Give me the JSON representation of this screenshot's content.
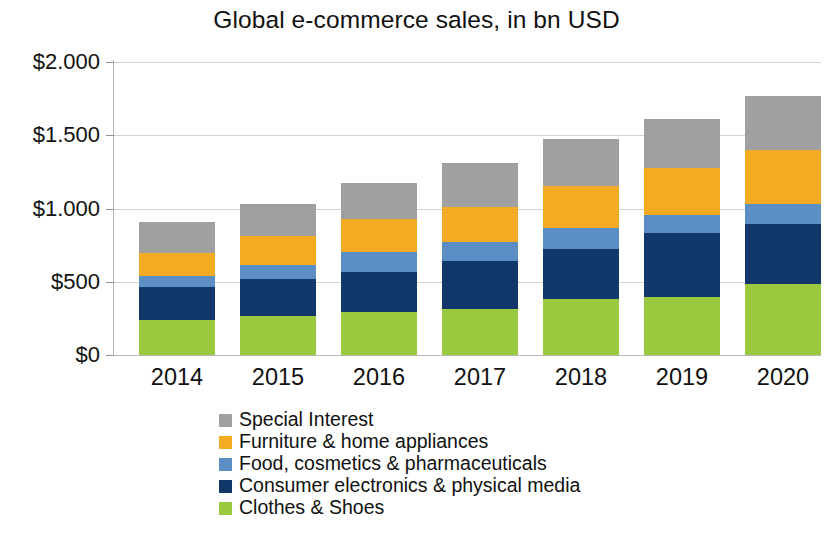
{
  "chart_data": {
    "type": "bar",
    "subtype": "stacked-column",
    "title": "Global e-commerce sales, in bn USD",
    "xlabel": "",
    "ylabel": "",
    "categories": [
      "2014",
      "2015",
      "2016",
      "2017",
      "2018",
      "2019",
      "2020"
    ],
    "ylim": [
      0,
      2000
    ],
    "ytick_values": [
      0,
      500,
      1000,
      1500,
      2000
    ],
    "ytick_labels": [
      "$0",
      "$500",
      "$1.000",
      "$1.500",
      "$2.000"
    ],
    "grid": true,
    "legend_position": "bottom",
    "stack_order_bottom_to_top": [
      "Clothes & Shoes",
      "Consumer electronics & physical media",
      "Food, cosmetics & pharmaceuticals",
      "Furniture & home appliances",
      "Special Interest"
    ],
    "series": [
      {
        "name": "Clothes & Shoes",
        "color": "#9ac93f",
        "values": [
          239,
          266,
          294,
          314,
          382,
          396,
          485
        ]
      },
      {
        "name": "Consumer electronics & physical media",
        "color": "#12386b",
        "values": [
          225,
          253,
          273,
          328,
          341,
          437,
          410
        ]
      },
      {
        "name": "Food, cosmetics & pharmaceuticals",
        "color": "#5b8ec4",
        "values": [
          75,
          96,
          137,
          130,
          143,
          123,
          136
        ]
      },
      {
        "name": "Furniture & home appliances",
        "color": "#f3ab24",
        "values": [
          157,
          198,
          225,
          239,
          287,
          321,
          369
        ]
      },
      {
        "name": "Special Interest",
        "color": "#a0a0a0",
        "values": [
          212,
          219,
          246,
          300,
          321,
          334,
          369
        ]
      }
    ],
    "totals": [
      908,
      1032,
      1175,
      1311,
      1474,
      1611,
      1769
    ]
  },
  "legend": {
    "items": [
      {
        "label": "Special Interest",
        "color": "#a0a0a0"
      },
      {
        "label": "Furniture & home appliances",
        "color": "#f3ab24"
      },
      {
        "label": "Food, cosmetics & pharmaceuticals",
        "color": "#5b8ec4"
      },
      {
        "label": "Consumer electronics & physical media",
        "color": "#12386b"
      },
      {
        "label": "Clothes & Shoes",
        "color": "#9ac93f"
      }
    ]
  },
  "colors": {
    "special_interest": "#a0a0a0",
    "furniture": "#f3ab24",
    "food": "#5b8ec4",
    "consumer_electronics": "#12386b",
    "clothes": "#9ac93f",
    "gridline": "#d3d3d3",
    "text": "#111111",
    "background": "#ffffff"
  }
}
